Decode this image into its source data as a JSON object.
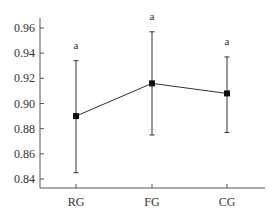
{
  "chart_data": {
    "type": "line",
    "title": "",
    "xlabel": "",
    "ylabel": "",
    "categories": [
      "RG",
      "FG",
      "CG"
    ],
    "series": [
      {
        "name": "mean",
        "values": [
          0.89,
          0.916,
          0.908
        ],
        "error_upper": [
          0.934,
          0.957,
          0.937
        ],
        "error_lower": [
          0.845,
          0.875,
          0.877
        ]
      }
    ],
    "annotations": [
      "a",
      "a",
      "a"
    ],
    "yticks": [
      0.84,
      0.86,
      0.88,
      0.9,
      0.92,
      0.94,
      0.96
    ],
    "ytick_labels": [
      "0.84",
      "0.86",
      "0.88",
      "0.90",
      "0.92",
      "0.94",
      "0.96"
    ],
    "ylim": [
      0.832,
      0.968
    ],
    "grid": false,
    "legend": null,
    "colors": {
      "line": "#333333",
      "marker": "#111111",
      "axis": "#555555"
    }
  }
}
